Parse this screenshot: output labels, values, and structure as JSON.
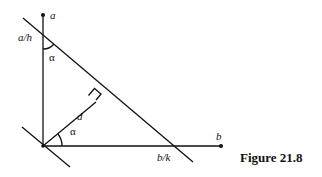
{
  "figure": {
    "caption": "Figure 21.8",
    "labels": {
      "a": "a",
      "a_over_h": "a/h",
      "alpha_top": "α",
      "d": "d",
      "alpha_bottom": "α",
      "b": "b",
      "b_over_k": "b/k"
    },
    "colors": {
      "line": "#111111",
      "background": "#ffffff"
    }
  }
}
